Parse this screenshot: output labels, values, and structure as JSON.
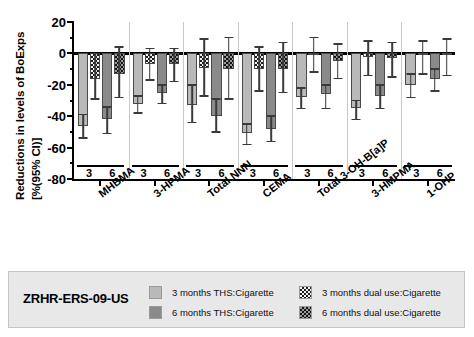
{
  "chart_data": {
    "type": "bar",
    "title": "",
    "xlabel": "",
    "ylabel": "Reductions in levels of BoExps [%(95% CI)]",
    "ylabel_line1": "Reductions in levels of BoExps",
    "ylabel_line2": "[%(95% CI)]",
    "ylim": [
      -80,
      20
    ],
    "yticks": [
      20,
      0,
      -20,
      -40,
      -60,
      -80
    ],
    "ytick_labels": [
      "20",
      "0",
      "-20",
      "-40",
      "-60",
      "-80"
    ],
    "grid": false,
    "legend_position": "bottom",
    "categories": [
      "MHBMA",
      "3-HPMA",
      "Total NNN",
      "CEMA",
      "Total 3-OH-B[a]P",
      "3-HMPMA",
      "1-OHP"
    ],
    "subgroup_labels": [
      "3",
      "6"
    ],
    "series": [
      {
        "name": "3 months THS:Cigarette",
        "color": "#b9b9b9",
        "pattern": "solid",
        "values": [
          -46,
          -32,
          -33,
          -51,
          -28,
          -35,
          -20
        ],
        "ci_low": [
          -54,
          -38,
          -44,
          -58,
          -35,
          -42,
          -28
        ],
        "ci_high": [
          -39,
          -27,
          -20,
          -45,
          -22,
          -30,
          -13
        ]
      },
      {
        "name": "3 months dual use:Cigarette",
        "color": "#f2f2f2",
        "pattern": "checkered",
        "values": [
          -16,
          -7,
          -9,
          -10,
          -1,
          -2,
          -1
        ],
        "ci_low": [
          -29,
          -17,
          -27,
          -24,
          -12,
          -14,
          -13
        ],
        "ci_high": [
          0,
          3,
          9,
          4,
          10,
          8,
          8
        ]
      },
      {
        "name": "6 months THS:Cigarette",
        "color": "#8a8a8a",
        "pattern": "solid",
        "values": [
          -42,
          -25,
          -40,
          -48,
          -26,
          -27,
          -16
        ],
        "ci_low": [
          -51,
          -32,
          -50,
          -56,
          -35,
          -35,
          -24
        ],
        "ci_high": [
          -34,
          -20,
          -29,
          -40,
          -20,
          -20,
          -10
        ]
      },
      {
        "name": "6 months dual use:Cigarette",
        "color": "#9a9a9a",
        "pattern": "checkered",
        "values": [
          -13,
          -7,
          -10,
          -10,
          -5,
          -3,
          -1
        ],
        "ci_low": [
          -28,
          -18,
          -29,
          -25,
          -16,
          -15,
          -14
        ],
        "ci_high": [
          4,
          3,
          10,
          7,
          6,
          7,
          9
        ]
      }
    ]
  },
  "legend": {
    "study_label": "ZRHR-ERS-09-US",
    "entries": [
      {
        "label": "3 months THS:Cigarette",
        "swatch": "light-gray-solid"
      },
      {
        "label": "3 months dual use:Cigarette",
        "swatch": "light-checkered"
      },
      {
        "label": "6 months THS:Cigarette",
        "swatch": "dark-gray-solid"
      },
      {
        "label": "6 months dual use:Cigarette",
        "swatch": "dark-checkered"
      }
    ]
  }
}
